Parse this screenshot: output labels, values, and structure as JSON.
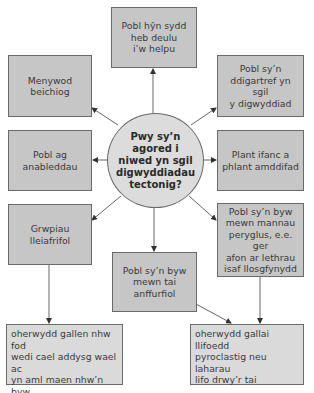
{
  "diagram": {
    "center": {
      "text": "Pwy sy’n agored i\nniwed yn sgil\ndigwyddiadau\ntectonig?"
    },
    "nodes": [
      {
        "id": "top",
        "text": "Pobl hŷn sydd\nheb deulu\ni’w helpu"
      },
      {
        "id": "upper-left",
        "text": "Menywod beichiog"
      },
      {
        "id": "upper-right",
        "text": "Pobl sy’n\nddigartref yn sgil\ny digwyddiad"
      },
      {
        "id": "middle-left",
        "text": "Pobl ag\nanableddau"
      },
      {
        "id": "middle-right",
        "text": "Plant ifanc a\nphlant amddifad"
      },
      {
        "id": "lower-left",
        "text": "Grwpiau lleiafrifol"
      },
      {
        "id": "lower-right",
        "text": "Pobl sy’n byw\nmewn mannau\nperyglus, e.e. ger\nafon ar lethrau\nisaf llosgfynydd"
      },
      {
        "id": "bottom",
        "text": "Pobl sy’n byw\nmewn tai\nanffurfiol"
      }
    ],
    "explanations": [
      {
        "id": "explain-left",
        "text": "oherwydd gallen nhw fod\nwedi cael addysg wael ac\nyn aml maen nhw’n byw\nmewn tai anffurfiol mewn\nmannau peryglus"
      },
      {
        "id": "explain-right",
        "text": "oherwydd gallai llifoedd\npyroclastig neu laharau\nlifo drwy’r tai"
      }
    ],
    "colors": {
      "box_fill": "#c6c6c6",
      "explanation_fill": "#dadada",
      "circle_fill": "#dcdcdc",
      "stroke": "#6a6a6a"
    }
  }
}
